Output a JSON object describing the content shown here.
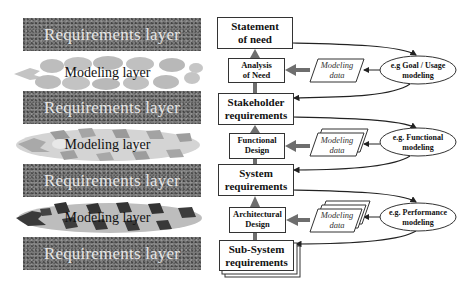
{
  "left_layers": [
    {
      "type": "requirements",
      "label": "Requirements layer"
    },
    {
      "type": "modeling",
      "label": "Modeling layer"
    },
    {
      "type": "requirements",
      "label": "Requirements layer"
    },
    {
      "type": "modeling",
      "label": "Modeling layer"
    },
    {
      "type": "requirements",
      "label": "Requirements layer"
    },
    {
      "type": "modeling",
      "label": "Modeling layer"
    },
    {
      "type": "requirements",
      "label": "Requirements layer"
    }
  ],
  "requirements_boxes": [
    {
      "line1": "Statement",
      "line2": "of need"
    },
    {
      "line1": "Stakeholder",
      "line2": "requirements"
    },
    {
      "line1": "System",
      "line2": "requirements"
    },
    {
      "line1": "Sub-System",
      "line2": "requirements"
    }
  ],
  "design_boxes": [
    {
      "line1": "Analysis",
      "line2": "of Need"
    },
    {
      "line1": "Functional",
      "line2": "Design"
    },
    {
      "line1": "Architectural",
      "line2": "Design"
    }
  ],
  "modeling_data": [
    {
      "line1": "Modeling",
      "line2": "data"
    },
    {
      "line1": "Modeling",
      "line2": "data"
    },
    {
      "line1": "Modeling",
      "line2": "data"
    }
  ],
  "modeling_ellipses": [
    {
      "line1": "e.g Goal / Usage",
      "line2": "modeling"
    },
    {
      "line1": "e.g. Functional",
      "line2": "modeling"
    },
    {
      "line1": "e.g. Performance",
      "line2": "modeling"
    }
  ],
  "colors": {
    "requirements_band": "#7a7a7a",
    "modeling_light": "#bdbdbd",
    "modeling_dark": "#3a3a3a",
    "arrow_gray": "#6e6e6e",
    "line": "#222222"
  }
}
